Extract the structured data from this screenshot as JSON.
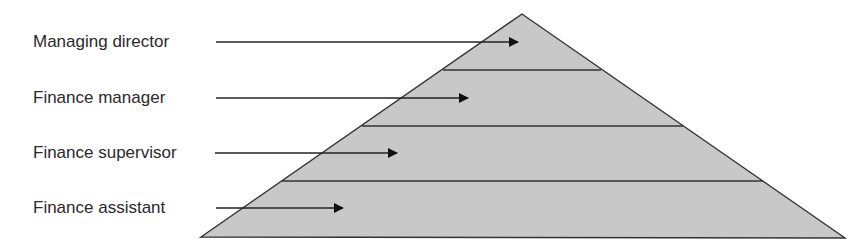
{
  "diagram": {
    "fill_color": "#c8c8c8",
    "stroke_color": "#333333",
    "levels": [
      {
        "label": "Managing director",
        "label_y": 32,
        "arrow_y": 42,
        "arrow_x1": 216,
        "arrow_x2": 518
      },
      {
        "label": "Finance manager",
        "label_y": 88,
        "arrow_y": 98,
        "arrow_x1": 216,
        "arrow_x2": 468
      },
      {
        "label": "Finance supervisor",
        "label_y": 143,
        "arrow_y": 153,
        "arrow_x1": 215,
        "arrow_x2": 397
      },
      {
        "label": "Finance assistant",
        "label_y": 198,
        "arrow_y": 208,
        "arrow_x1": 216,
        "arrow_x2": 343
      }
    ],
    "pyramid": {
      "apex": [
        522,
        14
      ],
      "bottom_left": [
        201,
        237
      ],
      "bottom_right": [
        845,
        238
      ],
      "band_lines": [
        {
          "y": 70,
          "x1": 443,
          "x2": 601
        },
        {
          "y": 126,
          "x1": 362,
          "x2": 683
        },
        {
          "y": 181,
          "x1": 282,
          "x2": 763
        }
      ]
    }
  }
}
